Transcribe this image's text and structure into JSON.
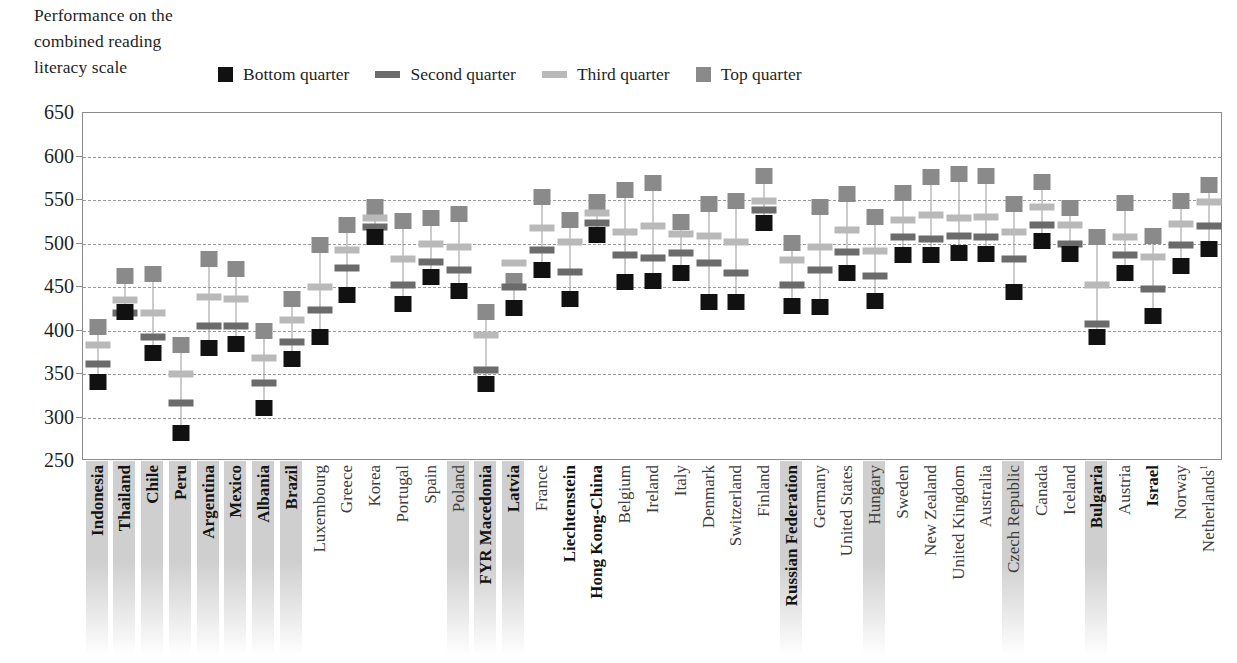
{
  "title": {
    "lines": [
      "Performance on the",
      "combined reading",
      "literacy scale"
    ]
  },
  "legend": {
    "position": "top",
    "items": [
      {
        "label": "Bottom quarter",
        "marker": "square",
        "color": "#111111",
        "name": "legend-bottom-quarter"
      },
      {
        "label": "Second quarter",
        "marker": "bar",
        "color": "#6b6b6b",
        "name": "legend-second-quarter"
      },
      {
        "label": "Third quarter",
        "marker": "bar",
        "color": "#b9b9b9",
        "name": "legend-third-quarter"
      },
      {
        "label": "Top quarter",
        "marker": "square",
        "color": "#8a8a8a",
        "name": "legend-top-quarter"
      }
    ]
  },
  "colors": {
    "bottom_quarter": "#111111",
    "second_quarter": "#6b6b6b",
    "third_quarter": "#b9b9b9",
    "top_quarter": "#8a8a8a",
    "gridline": "#9a9a9a",
    "axis": "#8a8a8a",
    "highlight_band": "#cfcfcf",
    "label_text": "#3d3d3d"
  },
  "footnote": "1",
  "chart_data": {
    "type": "scatter",
    "title": "Performance on the combined reading literacy scale",
    "xlabel": "",
    "ylabel": "",
    "ylim": [
      250,
      650
    ],
    "yticks": [
      250,
      300,
      350,
      400,
      450,
      500,
      550,
      600,
      650
    ],
    "grid": true,
    "legend_position": "top",
    "series_names": [
      "Bottom quarter",
      "Second quarter",
      "Third quarter",
      "Top quarter"
    ],
    "categories": [
      "Indonesia",
      "Thailand",
      "Chile",
      "Peru",
      "Argentina",
      "Mexico",
      "Albania",
      "Brazil",
      "Luxembourg",
      "Greece",
      "Korea",
      "Portugal",
      "Spain",
      "Poland",
      "FYR Macedonia",
      "Latvia",
      "France",
      "Liechtenstein",
      "Hong Kong-China",
      "Belgium",
      "Ireland",
      "Italy",
      "Denmark",
      "Switzerland",
      "Finland",
      "Russian Federation",
      "Germany",
      "United States",
      "Hungary",
      "Sweden",
      "New Zealand",
      "United Kingdom",
      "Australia",
      "Czech Republic",
      "Canada",
      "Iceland",
      "Bulgaria",
      "Austria",
      "Israel",
      "Norway",
      "Netherlands"
    ],
    "category_styles": [
      {
        "highlight": true,
        "bold": true
      },
      {
        "highlight": true,
        "bold": true
      },
      {
        "highlight": true,
        "bold": true
      },
      {
        "highlight": true,
        "bold": true
      },
      {
        "highlight": true,
        "bold": true
      },
      {
        "highlight": true,
        "bold": true
      },
      {
        "highlight": true,
        "bold": true
      },
      {
        "highlight": true,
        "bold": true
      },
      {
        "highlight": false,
        "bold": false
      },
      {
        "highlight": false,
        "bold": false
      },
      {
        "highlight": false,
        "bold": false
      },
      {
        "highlight": false,
        "bold": false
      },
      {
        "highlight": false,
        "bold": false
      },
      {
        "highlight": true,
        "bold": false
      },
      {
        "highlight": true,
        "bold": true
      },
      {
        "highlight": true,
        "bold": true
      },
      {
        "highlight": false,
        "bold": false
      },
      {
        "highlight": false,
        "bold": true
      },
      {
        "highlight": false,
        "bold": true
      },
      {
        "highlight": false,
        "bold": false
      },
      {
        "highlight": false,
        "bold": false
      },
      {
        "highlight": false,
        "bold": false
      },
      {
        "highlight": false,
        "bold": false
      },
      {
        "highlight": false,
        "bold": false
      },
      {
        "highlight": false,
        "bold": false
      },
      {
        "highlight": true,
        "bold": true
      },
      {
        "highlight": false,
        "bold": false
      },
      {
        "highlight": false,
        "bold": false
      },
      {
        "highlight": true,
        "bold": false
      },
      {
        "highlight": false,
        "bold": false
      },
      {
        "highlight": false,
        "bold": false
      },
      {
        "highlight": false,
        "bold": false
      },
      {
        "highlight": false,
        "bold": false
      },
      {
        "highlight": true,
        "bold": false
      },
      {
        "highlight": false,
        "bold": false
      },
      {
        "highlight": false,
        "bold": false
      },
      {
        "highlight": true,
        "bold": true
      },
      {
        "highlight": false,
        "bold": false
      },
      {
        "highlight": false,
        "bold": true
      },
      {
        "highlight": false,
        "bold": false
      },
      {
        "highlight": false,
        "bold": false
      }
    ],
    "category_superscripts": {
      "Netherlands": "1"
    },
    "series": [
      {
        "name": "Bottom quarter",
        "marker": "square",
        "color": "#111111",
        "values": [
          341,
          421,
          374,
          282,
          380,
          384,
          311,
          367,
          392,
          441,
          507,
          430,
          461,
          445,
          338,
          426,
          469,
          436,
          510,
          456,
          457,
          466,
          433,
          433,
          523,
          428,
          427,
          466,
          434,
          487,
          487,
          489,
          488,
          444,
          503,
          488,
          392,
          466,
          417,
          474,
          494
        ]
      },
      {
        "name": "Second quarter",
        "marker": "bar",
        "color": "#6b6b6b",
        "values": [
          361,
          420,
          393,
          317,
          405,
          405,
          340,
          387,
          424,
          472,
          519,
          452,
          479,
          470,
          355,
          450,
          492,
          467,
          524,
          487,
          483,
          489,
          478,
          466,
          538,
          452,
          469,
          490,
          463,
          507,
          505,
          509,
          508,
          482,
          521,
          500,
          407,
          487,
          448,
          498,
          520
        ]
      },
      {
        "name": "Third quarter",
        "marker": "bar",
        "color": "#b9b9b9",
        "values": [
          383,
          435,
          420,
          350,
          438,
          436,
          368,
          412,
          450,
          492,
          529,
          482,
          500,
          496,
          395,
          478,
          518,
          502,
          535,
          513,
          520,
          511,
          509,
          502,
          549,
          481,
          496,
          516,
          491,
          527,
          533,
          529,
          530,
          513,
          542,
          521,
          452,
          507,
          484,
          522,
          548
        ]
      },
      {
        "name": "Top quarter",
        "marker": "square",
        "color": "#8a8a8a",
        "values": [
          404,
          463,
          465,
          383,
          482,
          471,
          400,
          436,
          498,
          521,
          542,
          526,
          529,
          534,
          421,
          457,
          554,
          527,
          548,
          561,
          570,
          525,
          545,
          549,
          578,
          501,
          542,
          557,
          531,
          558,
          577,
          580,
          578,
          545,
          571,
          541,
          508,
          547,
          509,
          549,
          567
        ]
      }
    ]
  }
}
